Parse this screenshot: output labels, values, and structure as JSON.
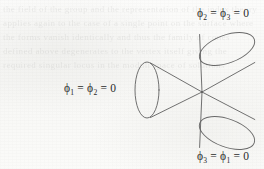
{
  "figure": {
    "name": "three-cones-intersecting-diagram",
    "stroke_color": "#5d5d5d",
    "text_color": "#2a2a2a",
    "background_color": "#fbfbfa",
    "vertex": {
      "x": 202,
      "y": 92
    }
  },
  "labels": {
    "top_right": {
      "full_text": "ϕ₂ = ϕ₃ = 0",
      "first_symbol": "ϕ",
      "first_subscript": "2",
      "second_symbol": "ϕ",
      "second_subscript": "3",
      "equals": "=",
      "value": "0"
    },
    "left": {
      "full_text": "ϕ₁ = ϕ₂ = 0",
      "first_symbol": "ϕ",
      "first_subscript": "1",
      "second_symbol": "ϕ",
      "second_subscript": "2",
      "equals": "=",
      "value": "0"
    },
    "bottom_right": {
      "full_text": "ϕ₃ = ϕ₁ = 0",
      "first_symbol": "ϕ",
      "first_subscript": "3",
      "second_symbol": "ϕ",
      "second_subscript": "1",
      "equals": "=",
      "value": "0"
    }
  },
  "cones": {
    "left": {
      "name": "left-cone",
      "label_ref": "labels.left",
      "base_center": {
        "x": 147,
        "y": 90
      },
      "base_rx": 12,
      "base_ry": 28,
      "apex": {
        "x": 202,
        "y": 92
      }
    },
    "upper_right": {
      "name": "upper-right-cone",
      "label_ref": "labels.top_right",
      "base_center": {
        "x": 227,
        "y": 49
      },
      "base_rx": 29,
      "base_ry": 14,
      "base_rotation_deg": -20,
      "apex": {
        "x": 202,
        "y": 92
      }
    },
    "lower_right": {
      "name": "lower-right-cone",
      "label_ref": "labels.bottom_right",
      "base_center": {
        "x": 227,
        "y": 133
      },
      "base_rx": 29,
      "base_ry": 14,
      "base_rotation_deg": 20,
      "apex": {
        "x": 202,
        "y": 92
      }
    }
  },
  "background": {
    "bleed_through_text": "the field of the group and the representation of the index theory applies again to the case of a single point on the surface where the forms vanish identically and thus the family of cones defined above degenerates to the vertex itself giving the required singular locus in the moduli space of solutions"
  }
}
